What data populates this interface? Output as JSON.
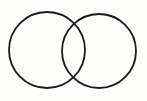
{
  "figure": {
    "title": "Two overlapping circles",
    "canvas": {
      "width": 147,
      "height": 101,
      "background_color": "#fdfdfc"
    },
    "stroke": {
      "color": "#1a1a1a",
      "width": 1.8,
      "fill": "none",
      "style": "solid"
    },
    "shapes": [
      {
        "name": "left-circle",
        "type": "circle",
        "cx": 47,
        "cy": 50,
        "r": 38
      },
      {
        "name": "right-circle",
        "type": "circle",
        "cx": 99,
        "cy": 51,
        "r": 37
      }
    ],
    "intersections": [
      {
        "name": "upper-intersection-point",
        "x": 73,
        "y": 18
      },
      {
        "name": "lower-intersection-point",
        "x": 73,
        "y": 85
      }
    ],
    "regions": [
      {
        "name": "left-only-region",
        "label": ""
      },
      {
        "name": "overlap-region",
        "label": ""
      },
      {
        "name": "right-only-region",
        "label": ""
      }
    ]
  }
}
